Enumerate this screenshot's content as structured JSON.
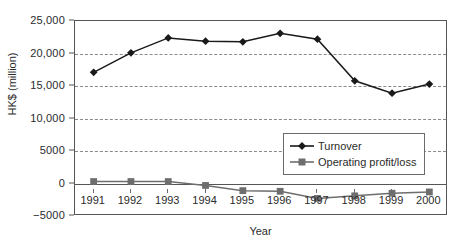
{
  "chart_data": {
    "type": "line",
    "title": "",
    "xlabel": "Year",
    "ylabel": "HK$ (million)",
    "categories": [
      "1991",
      "1992",
      "1993",
      "1994",
      "1995",
      "1996",
      "1997",
      "1998",
      "1999",
      "2000"
    ],
    "ylim": [
      -5000,
      25000
    ],
    "ytick_labels": [
      "25,000",
      "20,000",
      "15,000",
      "10,000",
      "5000",
      "0",
      "-5000"
    ],
    "ytick_values": [
      25000,
      20000,
      15000,
      10000,
      5000,
      0,
      -5000
    ],
    "grid": "horizontal-dashed",
    "legend_position": "inside-center-right",
    "series": [
      {
        "name": "Turnover",
        "marker": "diamond",
        "color": "#1a1a1a",
        "values": [
          17100,
          20100,
          22400,
          21900,
          21800,
          23100,
          22200,
          15800,
          13900,
          15300
        ]
      },
      {
        "name": "Operating profit/loss",
        "marker": "square",
        "color": "#6e6e6e",
        "values": [
          300,
          300,
          300,
          -300,
          -1100,
          -1200,
          -2300,
          -1900,
          -1500,
          -1300
        ]
      }
    ]
  },
  "legend": {
    "items": [
      {
        "label": "Turnover"
      },
      {
        "label": "Operating profit/loss"
      }
    ]
  },
  "axes": {
    "y_title": "HK$ (million)",
    "x_title": "Year"
  }
}
